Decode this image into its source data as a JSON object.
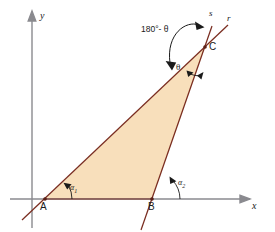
{
  "figure": {
    "caption_fragment": "",
    "axes": {
      "x_label": "x",
      "y_label": "y"
    },
    "points": [
      {
        "name": "A",
        "label": "A"
      },
      {
        "name": "B",
        "label": "B"
      },
      {
        "name": "C",
        "label": "C"
      }
    ],
    "lines": [
      {
        "name": "r",
        "label": "r",
        "through": "A-C"
      },
      {
        "name": "s",
        "label": "s",
        "through": "B-C"
      }
    ],
    "angles": [
      {
        "name": "alpha-1",
        "label": "α",
        "subscript": "1",
        "at": "A"
      },
      {
        "name": "alpha-2",
        "label": "α",
        "subscript": "2",
        "at": "B"
      },
      {
        "name": "theta",
        "label": "θ",
        "at": "C"
      },
      {
        "name": "supplement",
        "label": "180°- θ",
        "at": "C"
      }
    ],
    "colors": {
      "fill": "#f8dfbb",
      "stroke": "#7a2d20",
      "axis": "#8a8a8f",
      "text": "#1a1a1a"
    }
  }
}
